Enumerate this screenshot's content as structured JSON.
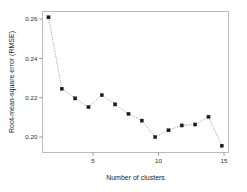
{
  "chart_data": {
    "type": "line",
    "title": "",
    "subtitle": "",
    "xlabel": "Number of clusters",
    "ylabel": "Root-mean-square error (RMSE)",
    "x": [
      2,
      3,
      4,
      5,
      6,
      7,
      8,
      9,
      10,
      11,
      12,
      13,
      14,
      15
    ],
    "values": [
      0.2625,
      0.2255,
      0.2205,
      0.216,
      0.2222,
      0.2174,
      0.2125,
      0.209,
      0.2005,
      0.204,
      0.2065,
      0.207,
      0.211,
      0.196
    ],
    "series": [
      {
        "name": "RMSE",
        "values": [
          0.2625,
          0.2255,
          0.2205,
          0.216,
          0.2222,
          0.2174,
          0.2125,
          0.209,
          0.2005,
          0.204,
          0.2065,
          0.207,
          0.211,
          0.196
        ]
      }
    ],
    "xlim": [
      1.55,
      15.5
    ],
    "ylim": [
      0.1925,
      0.2655
    ],
    "xticks": [
      5,
      10,
      15
    ],
    "xticklabels": [
      "5",
      "10",
      "15"
    ],
    "yticks": [
      0.2,
      0.22,
      0.24,
      0.26
    ],
    "yticklabels": [
      "0.20",
      "0.22",
      "0.24",
      "0.26"
    ],
    "grid": false,
    "legend": null,
    "legend_position": "none",
    "marker": "filled-square",
    "linestyle": "dotted",
    "line_color": "#8d8d8d",
    "marker_color": "#1a1a1a",
    "frame_color": "#b6b6b6",
    "background_color": "#ffffff",
    "annotations": []
  },
  "figure": {
    "xlabel": "Number of clusters",
    "ylabel": "Root-mean-square error (RMSE)"
  }
}
